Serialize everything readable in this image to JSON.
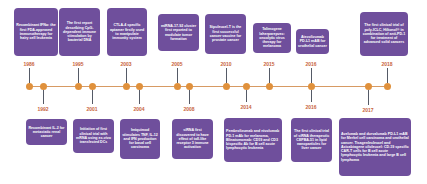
{
  "timeline": {
    "colors": {
      "card": "#6f4f9c",
      "year_text": "#c8643c",
      "dot": "#e0913c",
      "line": "#d79a63"
    },
    "top_events": [
      {
        "year": "1986",
        "text": "Recombinant IFNα: the first FDA-approved immunotherapy for hairy cell leukemia"
      },
      {
        "year": "1995",
        "text": "The first report describing CpG-dependent immune stimulation by bacterial DNA"
      },
      {
        "year": "2003",
        "text": "CTLA-4 specific aptamer firstly used to manipulate immunity system"
      },
      {
        "year": "2005",
        "text": "miRNA-17-92 cluster first reported to modulate tumor formation"
      },
      {
        "year": "2010",
        "text": "Sipuleucel-T is the first successful cancer vaccine for prostate cancer"
      },
      {
        "year": "2015",
        "text": "Talimogene laherparepvec: oncolytic virus therapy for melanoma"
      },
      {
        "year": "2016",
        "text": "Atezolizumab PD-L1 mAB for urothelial cancer"
      },
      {
        "year": "2018",
        "text": "The first clinical trial of poly-ICLC, Hiltonol® in combination of anti-PD-1 for treatment of advanced solid cancers"
      }
    ],
    "bottom_events": [
      {
        "year": "1992",
        "text": "Recombinant IL-2 for metastatic renal cancer"
      },
      {
        "year": "2001",
        "text": "Initiation of first clinical trial with mRNA using ex-vivo transfected DCs"
      },
      {
        "year": "2004",
        "text": "Imiquimod stimulates TNF, IL-12 and IFN production for basal cell carcinoma"
      },
      {
        "year": "2008",
        "text": "siRNA first discovered to have effect of toll-like receptor 3 immune activation"
      },
      {
        "year": "2014",
        "text": "Pembrolizumab and nivolumab PD-1 mAb for melanoma, Blinatumomab: CD19 and CD3 bispecific Ab for B cell acute lymphocytic leukemia"
      },
      {
        "year": "2016",
        "text": "The first clinical trial of siRNA therapeutic CEPBA-51 in lipid nanoparticles for liver cancer"
      },
      {
        "year": "2017",
        "text": "Avelumab and durvalumab PD-L1 mAB for Merkel cell carcinoma and urothelial cancer. Tisagenlecleucel and Axicabtagene ciloleucel: CD-19 specific CAR-T cells for B cell acute lymphocytic leukemia and large B cell lymphoma"
      }
    ]
  }
}
